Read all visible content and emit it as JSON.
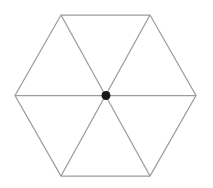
{
  "figure": {
    "shape_name": "hexagon",
    "background_color": "#ffffff",
    "canvas": {
      "width": 213,
      "height": 188
    }
  },
  "chart_data": {
    "type": "diagram",
    "xlabel": "",
    "ylabel": "",
    "grid": false,
    "legend": null,
    "annotations": [],
    "geometry": {
      "polygon": {
        "name": "hexagon",
        "sides": 6,
        "stroke_color": "#9c9c9c",
        "stroke_width": 1.25,
        "fill": "none",
        "vertices": [
          {
            "label": "left",
            "x": 15,
            "y": 95.5
          },
          {
            "label": "top-left",
            "x": 61,
            "y": 15
          },
          {
            "label": "top-right",
            "x": 150,
            "y": 15
          },
          {
            "label": "right",
            "x": 196,
            "y": 95.5
          },
          {
            "label": "bottom-right",
            "x": 150,
            "y": 176
          },
          {
            "label": "bottom-left",
            "x": 61,
            "y": 176
          }
        ],
        "points_attr": "15,95.5 61,15 150,15 196,95.5 150,176 61,176"
      },
      "center": {
        "label": "center",
        "x": 106,
        "y": 95.5,
        "marker": "filled-circle",
        "marker_radius": 4.5,
        "marker_color": "#191919"
      },
      "diagonals": [
        {
          "name": "diagonal-horizontal",
          "x1": 15,
          "y1": 95.5,
          "x2": 196,
          "y2": 95.5
        },
        {
          "name": "diagonal-topleft-bottomright",
          "x1": 61,
          "y1": 15,
          "x2": 150,
          "y2": 176
        },
        {
          "name": "diagonal-topright-bottomleft",
          "x1": 150,
          "y1": 15,
          "x2": 61,
          "y2": 176
        }
      ],
      "triangle_count": 6
    }
  }
}
